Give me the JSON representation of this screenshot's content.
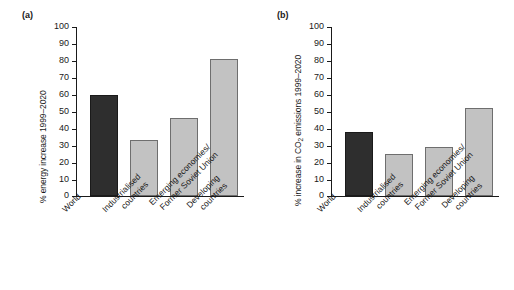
{
  "figure": {
    "background": "#ffffff",
    "bar_dark_color": "#2e2e2e",
    "bar_light_color": "#c2c2c2",
    "axis_color": "#1a1a1a"
  },
  "panels": [
    {
      "tag": "(a)",
      "ylabel": "% energy increase 1999–2020",
      "ylabel_plain": "% energy increase 1999-2020"
    },
    {
      "tag": "(b)",
      "ylabel_pre": "% increase in CO",
      "ylabel_sub": "2",
      "ylabel_post": " emissions 1999–2020"
    }
  ],
  "ticks": [
    "100",
    "90",
    "80",
    "70",
    "60",
    "50",
    "40",
    "30",
    "20",
    "10",
    "0"
  ],
  "categories": [
    {
      "line1": "World",
      "line2": ""
    },
    {
      "line1": "Industrialised",
      "line2": "countries"
    },
    {
      "line1": "Emerging economies/",
      "line2": "Former Soviet Union"
    },
    {
      "line1": "Developing",
      "line2": "countries"
    }
  ],
  "chart_data": [
    {
      "type": "bar",
      "panel": "(a)",
      "title": "",
      "xlabel": "",
      "ylabel": "% energy increase 1999–2020",
      "ylim": [
        0,
        100
      ],
      "yticks": [
        0,
        10,
        20,
        30,
        40,
        50,
        60,
        70,
        80,
        90,
        100
      ],
      "grid": false,
      "legend": "none",
      "categories": [
        "World",
        "Industrialised countries",
        "Emerging economies/Former Soviet Union",
        "Developing countries"
      ],
      "values": [
        60,
        33,
        46,
        81
      ],
      "bar_colors": [
        "#2e2e2e",
        "#c2c2c2",
        "#c2c2c2",
        "#c2c2c2"
      ]
    },
    {
      "type": "bar",
      "panel": "(b)",
      "title": "",
      "xlabel": "",
      "ylabel": "% increase in CO2 emissions 1999–2020",
      "ylim": [
        0,
        100
      ],
      "yticks": [
        0,
        10,
        20,
        30,
        40,
        50,
        60,
        70,
        80,
        90,
        100
      ],
      "grid": false,
      "legend": "none",
      "categories": [
        "World",
        "Industrialised countries",
        "Emerging economies/Former Soviet Union",
        "Developing countries"
      ],
      "values": [
        38,
        25,
        29,
        52
      ],
      "bar_colors": [
        "#2e2e2e",
        "#c2c2c2",
        "#c2c2c2",
        "#c2c2c2"
      ]
    }
  ]
}
